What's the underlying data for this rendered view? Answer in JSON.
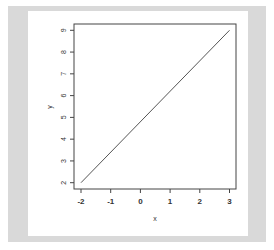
{
  "chart_data": {
    "type": "line",
    "title": "",
    "xlabel": "x",
    "ylabel": "y",
    "x": [
      -2,
      3
    ],
    "series": [
      {
        "name": "y",
        "values": [
          2,
          9
        ]
      }
    ],
    "x_ticks": [
      -2,
      -1,
      0,
      1,
      2,
      3
    ],
    "y_ticks": [
      2,
      3,
      4,
      5,
      6,
      7,
      8,
      9
    ],
    "xlim": [
      -2.2,
      3.2
    ],
    "ylim": [
      1.7,
      9.3
    ],
    "grid": false,
    "legend": null,
    "line_color": "#555555"
  },
  "colors": {
    "outer_background": "#d9d9d9",
    "panel_background": "#ffffff",
    "axis": "#444444"
  }
}
